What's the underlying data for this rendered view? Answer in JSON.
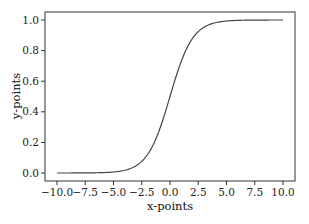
{
  "chart_data": {
    "type": "line",
    "title": "",
    "xlabel": "x-points",
    "ylabel": "y-points",
    "xlim": [
      -11,
      11
    ],
    "ylim": [
      -0.05,
      1.05
    ],
    "grid": false,
    "legend": null,
    "x_ticks": [
      -10.0,
      -7.5,
      -5.0,
      -2.5,
      0.0,
      2.5,
      5.0,
      7.5,
      10.0
    ],
    "x_tick_labels": [
      "−10.0",
      "−7.5",
      "−5.0",
      "−2.5",
      "0.0",
      "2.5",
      "5.0",
      "7.5",
      "10.0"
    ],
    "y_ticks": [
      0.0,
      0.2,
      0.4,
      0.6,
      0.8,
      1.0
    ],
    "y_tick_labels": [
      "0.0",
      "0.2",
      "0.4",
      "0.6",
      "0.8",
      "1.0"
    ],
    "series": [
      {
        "name": "sigmoid",
        "color": "#444444",
        "function": "1/(1+exp(-x))",
        "x": [
          -10,
          -8,
          -6,
          -5,
          -4,
          -3,
          -2,
          -1,
          0,
          1,
          2,
          3,
          4,
          5,
          6,
          8,
          10
        ],
        "y": [
          0.0,
          0.0003,
          0.0025,
          0.0067,
          0.018,
          0.047,
          0.119,
          0.269,
          0.5,
          0.731,
          0.881,
          0.953,
          0.982,
          0.993,
          0.9975,
          0.9997,
          1.0
        ]
      }
    ]
  }
}
